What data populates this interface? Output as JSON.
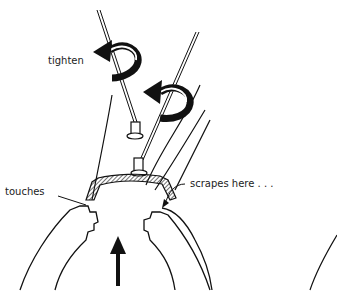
{
  "diagram": {
    "labels": {
      "tighten": "tighten",
      "touches": "touches",
      "scrapes": "scrapes here . . ."
    },
    "colors": {
      "ink": "#111111",
      "background": "#ffffff"
    },
    "icons": [
      "rotation-arrow-icon",
      "rotation-arrow-icon",
      "upward-arrow-icon"
    ]
  }
}
